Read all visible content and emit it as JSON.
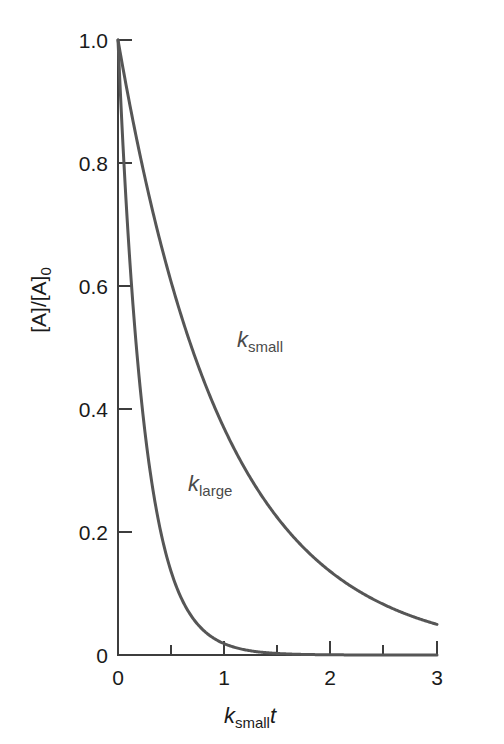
{
  "chart_data": {
    "type": "line",
    "title": "",
    "subtitle": "",
    "xlabel": "k_small t",
    "xlabel_parts": {
      "italic_main": "k",
      "subscript": "small",
      "italic_tail": "t"
    },
    "ylabel": "[A]/[A]_0",
    "ylabel_parts": {
      "main": "[A]/[A]",
      "subscript": "0"
    },
    "xlim": [
      0,
      3
    ],
    "ylim": [
      0,
      1.0
    ],
    "grid": false,
    "legend_position": "inline-annotations",
    "x_major_ticks": [
      0,
      1,
      2,
      3
    ],
    "x_minor_ticks": [
      0.5,
      1.5,
      2.5
    ],
    "x_tick_labels": [
      "0",
      "1",
      "2",
      "3"
    ],
    "y_major_ticks": [
      0,
      0.2,
      0.4,
      0.6,
      0.8,
      1.0
    ],
    "y_tick_labels": [
      "0",
      "0.2",
      "0.4",
      "0.6",
      "0.8",
      "1.0"
    ],
    "series": [
      {
        "name": "k_small",
        "label_main": "k",
        "label_subscript": "small",
        "decay_constant": 1.0,
        "color": "#565656",
        "x": [
          0,
          0.25,
          0.5,
          0.75,
          1.0,
          1.25,
          1.5,
          1.75,
          2.0,
          2.25,
          2.5,
          2.75,
          3.0
        ],
        "values": [
          1.0,
          0.779,
          0.607,
          0.472,
          0.368,
          0.287,
          0.223,
          0.174,
          0.135,
          0.105,
          0.082,
          0.064,
          0.05
        ]
      },
      {
        "name": "k_large",
        "label_main": "k",
        "label_subscript": "large",
        "decay_constant": 4.0,
        "color": "#565656",
        "x": [
          0,
          0.25,
          0.5,
          0.75,
          1.0,
          1.25,
          1.5,
          1.75,
          2.0,
          2.25,
          2.5,
          2.75,
          3.0
        ],
        "values": [
          1.0,
          0.368,
          0.135,
          0.05,
          0.018,
          0.0067,
          0.0025,
          0.0009,
          0.0003,
          0.0001,
          0.0,
          0.0,
          0.0
        ]
      }
    ],
    "annotations": [
      {
        "text": "k_small",
        "x": 1.12,
        "y": 0.5
      },
      {
        "text": "k_large",
        "x": 0.6,
        "y": 0.265
      }
    ]
  },
  "axis": {
    "y_labels": [
      "1.0",
      "0.8",
      "0.6",
      "0.4",
      "0.2",
      "0"
    ],
    "x_labels": [
      "0",
      "1",
      "2",
      "3"
    ],
    "y_title_main": "[A]/[A]",
    "y_title_sub": "0",
    "x_title_main": "k",
    "x_title_sub": "small",
    "x_title_tail": "t"
  },
  "colors": {
    "curve": "#565656",
    "axis": "#3d3d3d",
    "text": "#1a1a1a",
    "label_text": "#4a4a4a",
    "background": "#ffffff"
  }
}
